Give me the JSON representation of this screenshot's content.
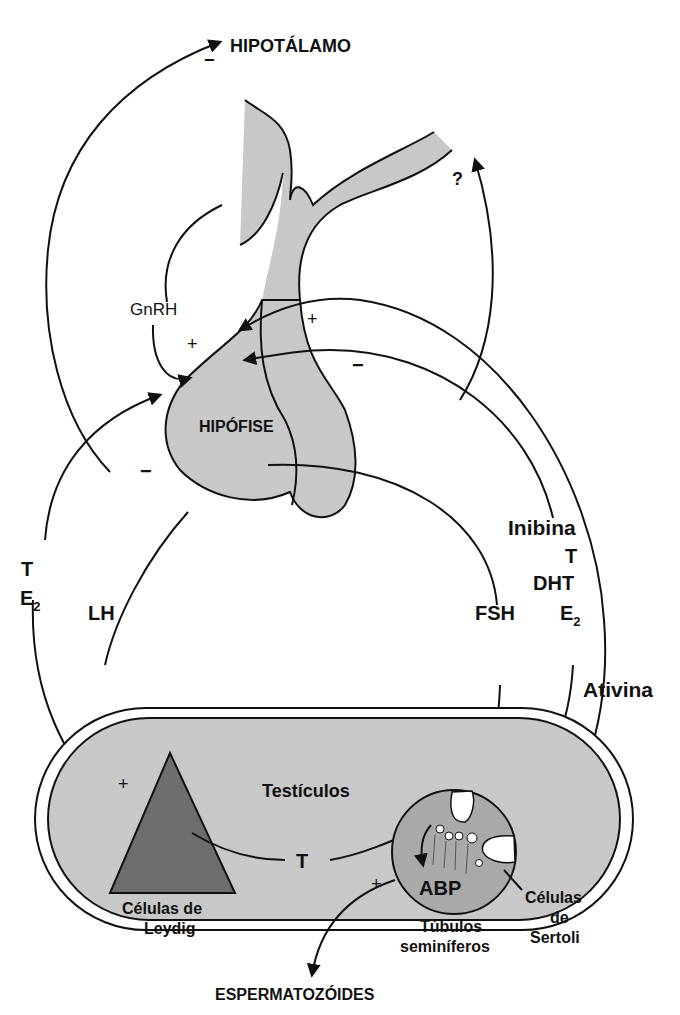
{
  "organs": {
    "hypothalamus": "HIPOTÁLAMO",
    "pituitary": "HIPÓFISE",
    "testes": "Testículos",
    "leydig_line1": "Células de",
    "leydig_line2": "Leydig",
    "sertoli_line1": "Células",
    "sertoli_line2": "de",
    "sertoli_line3": "Sertoli",
    "tubules_line1": "Túbulos",
    "tubules_line2": "seminíferos",
    "abp": "ABP",
    "output": "ESPERMATOZÓIDES"
  },
  "hormones": {
    "gnrh": "GnRH",
    "lh": "LH",
    "fsh": "FSH",
    "t_left": "T",
    "e2_left": "E",
    "e2_left_sub": "2",
    "t_mid": "T",
    "inhibina": "Inibina",
    "t_right": "T",
    "dht": "DHT",
    "e2_right": "E",
    "e2_right_sub": "2",
    "ativina": "Ativina",
    "unknown": "?"
  },
  "signs": {
    "hypothalamus_minus": "−",
    "gnrh_plus": "+",
    "ativina_plus": "+",
    "inhibina_minus": "−",
    "te2_minus": "−",
    "lh_plus": "+",
    "tubule_plus": "+"
  },
  "colors": {
    "light_gray": "#c8c8c8",
    "mid_gray": "#a9a9a9",
    "dark_gray": "#6e6e6e",
    "stroke": "#111111",
    "white": "#ffffff"
  }
}
